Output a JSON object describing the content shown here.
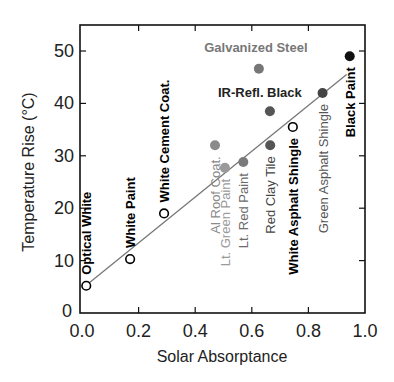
{
  "chart_data": {
    "type": "scatter",
    "title": "",
    "xlabel": "Solar Absorptance",
    "ylabel": "Temperature Rise (°C)",
    "xlim": [
      0.0,
      1.0
    ],
    "ylim": [
      0,
      55
    ],
    "xticks": [
      "0.0",
      "0.2",
      "0.4",
      "0.6",
      "0.8",
      "1.0"
    ],
    "yticks": [
      "0",
      "10",
      "20",
      "30",
      "40",
      "50"
    ],
    "grid": false,
    "legend": null,
    "fit_line": {
      "x": [
        0.015,
        0.935
      ],
      "y": [
        5.3,
        45.5
      ],
      "color": "#777777"
    },
    "points": [
      {
        "label": "Optical White",
        "x": 0.015,
        "y": 5.2,
        "marker": "open",
        "color": "#000000",
        "label_color": "#000000",
        "label_weight": "bold",
        "label_orient": "vertical"
      },
      {
        "label": "White Paint",
        "x": 0.17,
        "y": 10.3,
        "marker": "open",
        "color": "#000000",
        "label_color": "#000000",
        "label_weight": "bold",
        "label_orient": "vertical"
      },
      {
        "label": "White Cement Coat.",
        "x": 0.29,
        "y": 19.0,
        "marker": "open",
        "color": "#000000",
        "label_color": "#000000",
        "label_weight": "bold",
        "label_orient": "vertical"
      },
      {
        "label": "Al Roof Coat.",
        "x": 0.47,
        "y": 32.0,
        "marker": "filled",
        "color": "#8a8a8a",
        "label_color": "#8a8a8a",
        "label_weight": "normal",
        "label_orient": "vertical"
      },
      {
        "label": "Lt. Green Paint",
        "x": 0.505,
        "y": 27.7,
        "marker": "filled",
        "color": "#9a9a9a",
        "label_color": "#9a9a9a",
        "label_weight": "normal",
        "label_orient": "vertical"
      },
      {
        "label": "Lt. Red Paint",
        "x": 0.57,
        "y": 28.8,
        "marker": "filled",
        "color": "#7a7a7a",
        "label_color": "#6a6a6a",
        "label_weight": "normal",
        "label_orient": "vertical"
      },
      {
        "label": "Galvanized Steel",
        "x": 0.625,
        "y": 46.6,
        "marker": "filled",
        "color": "#777777",
        "label_color": "#777777",
        "label_weight": "bold",
        "label_orient": "horizontal"
      },
      {
        "label": "IR-Refl. Black",
        "x": 0.664,
        "y": 38.5,
        "marker": "filled",
        "color": "#555555",
        "label_color": "#222222",
        "label_weight": "bold",
        "label_orient": "horizontal"
      },
      {
        "label": "Red Clay Tile",
        "x": 0.665,
        "y": 32.0,
        "marker": "filled",
        "color": "#555555",
        "label_color": "#444444",
        "label_weight": "normal",
        "label_orient": "vertical"
      },
      {
        "label": "White Asphalt Shingle",
        "x": 0.745,
        "y": 35.5,
        "marker": "open",
        "color": "#000000",
        "label_color": "#000000",
        "label_weight": "bold",
        "label_orient": "vertical"
      },
      {
        "label": "Green Asphalt Shingle",
        "x": 0.85,
        "y": 42.0,
        "marker": "filled",
        "color": "#444444",
        "label_color": "#555555",
        "label_weight": "normal",
        "label_orient": "vertical"
      },
      {
        "label": "Black Paint",
        "x": 0.946,
        "y": 49.0,
        "marker": "filled",
        "color": "#111111",
        "label_color": "#000000",
        "label_weight": "bold",
        "label_orient": "vertical"
      }
    ]
  }
}
